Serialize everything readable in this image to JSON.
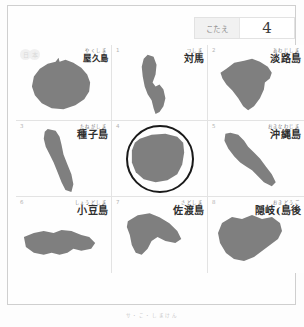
{
  "answer_bar": {
    "label": "こたえ",
    "value": "4"
  },
  "cells": [
    {
      "number": "",
      "badge": true,
      "badge_chars": [
        "日",
        "本"
      ],
      "furigana": "やくしま",
      "kanji": "屋久島",
      "circled": false
    },
    {
      "number": "1",
      "badge": false,
      "furigana": "つしま",
      "kanji": "対馬",
      "circled": false
    },
    {
      "number": "2",
      "badge": false,
      "furigana": "あわじしま",
      "kanji": "淡路島",
      "circled": false
    },
    {
      "number": "3",
      "badge": false,
      "furigana": "たねがしま",
      "kanji": "種子島",
      "circled": false
    },
    {
      "number": "4",
      "badge": false,
      "furigana": "",
      "kanji": "",
      "circled": true
    },
    {
      "number": "5",
      "badge": false,
      "furigana": "おきなわじま",
      "kanji": "沖縄島",
      "circled": false
    },
    {
      "number": "6",
      "badge": false,
      "furigana": "しょうどしま",
      "kanji": "小豆島",
      "circled": false
    },
    {
      "number": "7",
      "badge": false,
      "furigana": "さどしま",
      "kanji": "佐渡島",
      "circled": false
    },
    {
      "number": "8",
      "badge": false,
      "furigana": "おきどうご",
      "kanji": "隠岐(島後",
      "circled": false
    }
  ],
  "caption": "サ・こ・しまけん",
  "colors": {
    "island_fill": "#7f7f7f",
    "ring": "#1a1a1a",
    "grid_line": "#e3e3e3",
    "frame": "#cfcfcf"
  }
}
